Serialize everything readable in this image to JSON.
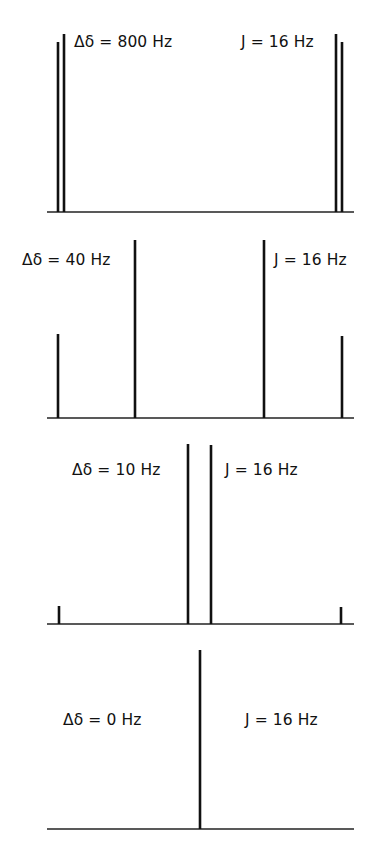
{
  "figure": {
    "panels": [
      {
        "delta_label": "Δδ = 800 Hz",
        "j_label": "J = 16 Hz"
      },
      {
        "delta_label": "Δδ = 40 Hz",
        "j_label": "J = 16 Hz"
      },
      {
        "delta_label": "Δδ = 10 Hz",
        "j_label": "J = 16 Hz"
      },
      {
        "delta_label": "Δδ = 0 Hz",
        "j_label": "J = 16 Hz"
      }
    ]
  },
  "chart_data": [
    {
      "type": "stick-spectrum",
      "title": "Δδ = 800 Hz, J = 16 Hz",
      "baseline": {
        "x1": 47,
        "x2": 354,
        "y": 212
      },
      "peaks": [
        {
          "x": 58,
          "top": 42,
          "relative_intensity": 0.96
        },
        {
          "x": 64,
          "top": 34,
          "relative_intensity": 1.0
        },
        {
          "x": 336,
          "top": 34,
          "relative_intensity": 1.0
        },
        {
          "x": 342,
          "top": 42,
          "relative_intensity": 0.96
        }
      ]
    },
    {
      "type": "stick-spectrum",
      "title": "Δδ = 40 Hz, J = 16 Hz",
      "baseline": {
        "x1": 47,
        "x2": 354,
        "y": 418
      },
      "peaks": [
        {
          "x": 58,
          "top": 334,
          "relative_intensity": 0.47
        },
        {
          "x": 135,
          "top": 240,
          "relative_intensity": 1.0
        },
        {
          "x": 264,
          "top": 240,
          "relative_intensity": 1.0
        },
        {
          "x": 342,
          "top": 336,
          "relative_intensity": 0.46
        }
      ]
    },
    {
      "type": "stick-spectrum",
      "title": "Δδ = 10 Hz, J = 16 Hz",
      "baseline": {
        "x1": 47,
        "x2": 354,
        "y": 624
      },
      "peaks": [
        {
          "x": 59,
          "top": 606,
          "relative_intensity": 0.1
        },
        {
          "x": 188,
          "top": 444,
          "relative_intensity": 1.0
        },
        {
          "x": 211,
          "top": 445,
          "relative_intensity": 0.99
        },
        {
          "x": 341,
          "top": 607,
          "relative_intensity": 0.1
        }
      ]
    },
    {
      "type": "stick-spectrum",
      "title": "Δδ = 0 Hz, J = 16 Hz",
      "baseline": {
        "x1": 47,
        "x2": 354,
        "y": 829
      },
      "peaks": [
        {
          "x": 200,
          "top": 650,
          "relative_intensity": 1.0
        }
      ]
    }
  ]
}
